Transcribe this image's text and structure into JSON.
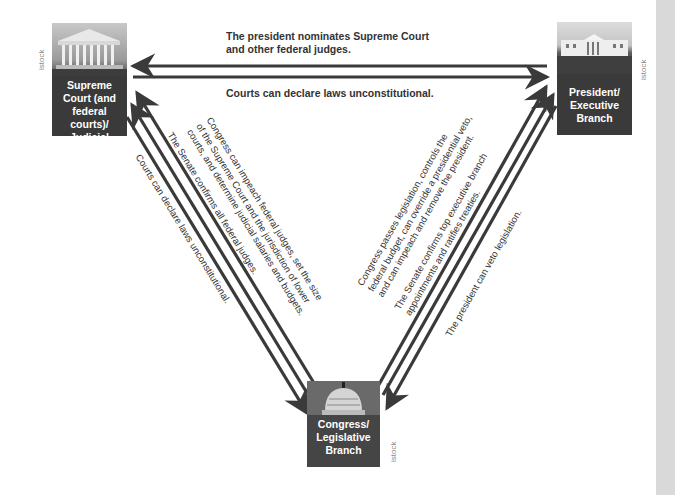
{
  "branches": {
    "judicial": {
      "label_lines": [
        "Supreme",
        "Court (and",
        "federal courts)/",
        "Judicial Branch"
      ],
      "photo": "supreme-court-building",
      "credit": "istock"
    },
    "executive": {
      "label_lines": [
        "President/",
        "Executive",
        "Branch"
      ],
      "photo": "white-house",
      "credit": "istock"
    },
    "legislative": {
      "label_lines": [
        "Congress/",
        "Legislative",
        "Branch"
      ],
      "photo": "capitol-dome",
      "credit": "istock"
    }
  },
  "relations": {
    "exec_to_judicial": {
      "lines": [
        "The president nominates Supreme Court",
        "and other federal judges."
      ]
    },
    "judicial_to_exec": {
      "lines": [
        "Courts can declare laws unconstitutional."
      ]
    },
    "leg_to_judicial_1": {
      "lines": [
        "Congress can impeach federal judges, set the size",
        "of the Supreme Court and the jurisdiction of lower",
        "courts, and determine judicial salaries and budgets."
      ]
    },
    "leg_to_judicial_2": {
      "lines": [
        "The Senate confirms all federal judges."
      ]
    },
    "judicial_to_leg": {
      "lines": [
        "Courts can declare laws unconstitutional."
      ]
    },
    "leg_to_exec_1": {
      "lines": [
        "Congress passes legislation, controls the",
        "federal budget, can override a presidential veto,",
        "and can impeach and remove the president."
      ]
    },
    "leg_to_exec_2": {
      "lines": [
        "The Senate confirms top executive branch",
        "appointments and ratifies treaties."
      ]
    },
    "exec_to_leg": {
      "lines": [
        "The president can veto legislation."
      ]
    }
  },
  "colors": {
    "box": "#3a3a3a",
    "arrow": "#3a3a3a",
    "text": "#333333",
    "sidebar": "#d9d9d9"
  }
}
